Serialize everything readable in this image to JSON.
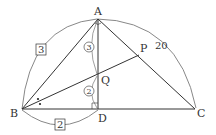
{
  "diagram": {
    "points": {
      "A": {
        "label": "A",
        "x": 98,
        "y": 19
      },
      "B": {
        "label": "B",
        "x": 22,
        "y": 109
      },
      "C": {
        "label": "C",
        "x": 195,
        "y": 109
      },
      "D": {
        "label": "D",
        "x": 98,
        "y": 109
      },
      "P": {
        "label": "P",
        "x": 139,
        "y": 55
      },
      "Q": {
        "label": "Q",
        "x": 98,
        "y": 75
      }
    },
    "measures": {
      "AB_boxed": "3",
      "BD_boxed": "2",
      "AQ_circled": "3",
      "QD_circled": "2",
      "AC_length": "20"
    },
    "colors": {
      "line": "#333333",
      "arc": "#888888"
    }
  }
}
